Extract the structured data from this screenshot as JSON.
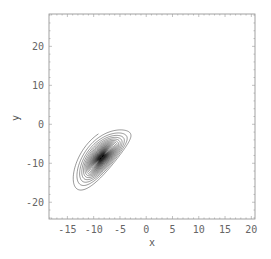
{
  "chart_data": {
    "type": "line",
    "title": "",
    "xlabel": "x",
    "ylabel": "y",
    "xlim": [
      -18.5,
      20.7
    ],
    "ylim": [
      -24.3,
      28.3
    ],
    "xticks": [
      -15,
      -10,
      -5,
      0,
      5,
      10,
      15,
      20
    ],
    "yticks": [
      -20,
      -10,
      0,
      10,
      20
    ],
    "xtick_labels": [
      "-15",
      "-10",
      "-5",
      "0",
      "5",
      "10",
      "15",
      "20"
    ],
    "ytick_labels": [
      "-20",
      "-10",
      "0",
      "10",
      "20"
    ],
    "grid": false,
    "legend": null,
    "series": [
      {
        "name": "Lorenz attractor (x-y projection)",
        "description": "Double-scroll trajectory spiraling around two foci near (-8.5,-8.5) and (8.5,8.5)",
        "system": {
          "sigma": 10,
          "rho": 28,
          "beta": 2.6667
        },
        "initial": [
          -8.0,
          -8.5,
          27.0
        ],
        "dt": 0.004,
        "steps": 9000,
        "color": "#222222"
      }
    ]
  },
  "frame": {
    "color": "#888888"
  }
}
